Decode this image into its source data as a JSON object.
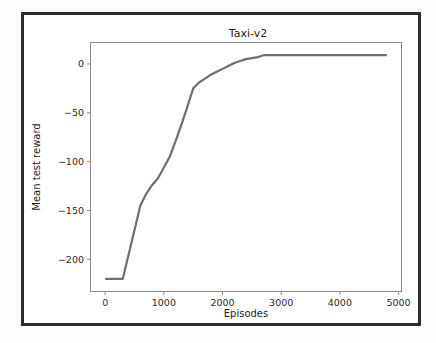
{
  "figure": {
    "background_color": "#ffffff",
    "frame_color": "#2b2b2b"
  },
  "chart_data": {
    "type": "line",
    "title": "Taxi-v2",
    "xlabel": "Episodes",
    "ylabel": "Mean test reward",
    "xlim": [
      -250,
      5050
    ],
    "ylim": [
      -233,
      22
    ],
    "xticks": [
      0,
      1000,
      2000,
      3000,
      4000,
      5000
    ],
    "xtick_labels": [
      "0",
      "1000",
      "2000",
      "3000",
      "4000",
      "5000"
    ],
    "yticks": [
      0,
      -50,
      -100,
      -150,
      -200
    ],
    "ytick_labels": [
      "0",
      "−50",
      "−100",
      "−150",
      "−200"
    ],
    "grid": false,
    "legend": null,
    "series": [
      {
        "name": "Mean test reward",
        "color": "#6f6f6f",
        "linewidth": 2.2,
        "x": [
          0,
          100,
          200,
          300,
          400,
          500,
          600,
          700,
          800,
          900,
          1000,
          1100,
          1200,
          1300,
          1400,
          1500,
          1600,
          1700,
          1800,
          1900,
          2000,
          2100,
          2200,
          2300,
          2400,
          2500,
          2600,
          2700,
          2800,
          3000,
          3200,
          3400,
          3600,
          3800,
          4000,
          4200,
          4400,
          4600,
          4800
        ],
        "y": [
          -220,
          -220,
          -220,
          -220,
          -195,
          -170,
          -145,
          -133,
          -124,
          -117,
          -106,
          -95,
          -79,
          -62,
          -44,
          -25,
          -19,
          -15,
          -11,
          -8,
          -5,
          -2,
          1,
          3,
          5,
          6,
          7,
          9,
          9,
          9,
          9,
          9,
          9,
          9,
          9,
          9,
          9,
          9,
          9
        ]
      }
    ]
  }
}
